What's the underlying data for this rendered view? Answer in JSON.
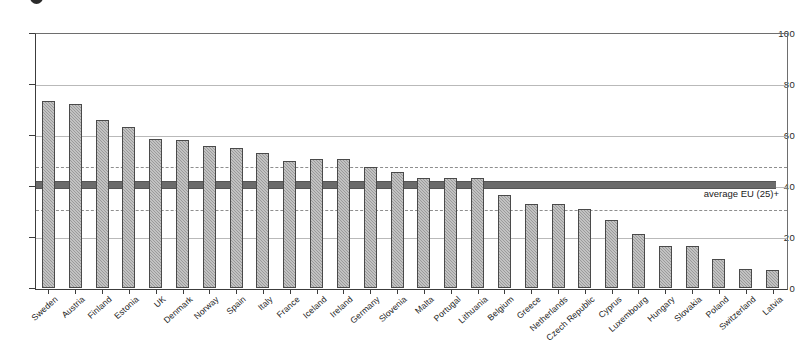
{
  "title_fragment": {
    "visible_text": "",
    "note_glyph": "bullet-glyph"
  },
  "chart_data": {
    "type": "bar",
    "title": "",
    "subtitle": "",
    "xlabel": "",
    "ylabel": "",
    "ylim": [
      0,
      100
    ],
    "yticks": [
      0,
      20,
      40,
      60,
      80,
      100
    ],
    "ytick_labels": [
      "0",
      "20",
      "40",
      "60",
      "80",
      "100"
    ],
    "grid": true,
    "legend_position": "none",
    "categories": [
      "Sweden",
      "Austria",
      "Finland",
      "Estonia",
      "UK",
      "Denmark",
      "Norway",
      "Spain",
      "Italy",
      "France",
      "Iceland",
      "Ireland",
      "Germany",
      "Slovenia",
      "Malta",
      "Portugal",
      "Lithuania",
      "Belgium",
      "Greece",
      "Netherlands",
      "Czech Republic",
      "Cyprus",
      "Luxembourg",
      "Hungary",
      "Slovakia",
      "Poland",
      "Switzerland",
      "Latvia"
    ],
    "values": [
      73.5,
      72,
      66,
      63,
      58.5,
      58,
      55.5,
      55,
      53,
      50,
      50.5,
      50.5,
      47.5,
      45.5,
      43,
      43,
      43,
      36.5,
      33,
      33,
      31,
      26.5,
      21,
      16.5,
      16.5,
      11.5,
      7.5,
      7
    ],
    "series": [
      {
        "name": "value",
        "values": [
          73.5,
          72,
          66,
          63,
          58.5,
          58,
          55.5,
          55,
          53,
          50,
          50.5,
          50.5,
          47.5,
          45.5,
          43,
          43,
          43,
          36.5,
          33,
          33,
          31,
          26.5,
          21,
          16.5,
          16.5,
          11.5,
          7.5,
          7
        ]
      }
    ],
    "annotations": [
      {
        "type": "reference-line",
        "style": "thick-solid",
        "value": 41,
        "label": "average EU (25)+"
      },
      {
        "type": "reference-line",
        "style": "dashed",
        "value": 48,
        "label": ""
      },
      {
        "type": "reference-line",
        "style": "dashed",
        "value": 31,
        "label": ""
      }
    ],
    "bar_color": "#9a9a9a",
    "bar_edge_color": "#4a4a4a",
    "average_line_color": "#6b6b6b",
    "gridline_color": "#b9b9b9",
    "dashed_line_color": "#8e8e8e",
    "axis_color": "#3c3c3c"
  }
}
